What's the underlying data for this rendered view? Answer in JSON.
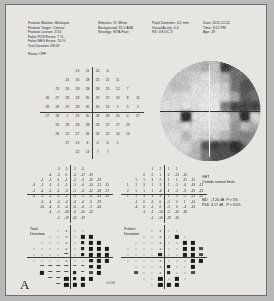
{
  "panel_label": "A",
  "header": {
    "col1": [
      "Fixation Monitor: Blinkspot",
      "Fixation Target: Central",
      "Fixation Losses: 2/13",
      "False POS Errors:  7 %",
      "False NEG Errors: 10 %",
      "Test Duration: 08:09"
    ],
    "fovea": "Fovea: OFF",
    "col2": [
      "Stimulus: III, White",
      "Background: 31.5 ASB",
      "Strategy: SITA-Fast"
    ],
    "col3": [
      "Pupil Diameter: 4.2 mm",
      "Visual Acuity: 0.4",
      "RX:       DS       DC      X"
    ],
    "col4": [
      "Date: 2011-12-22",
      "Time: 3:01 PM",
      "Age: 29"
    ]
  },
  "threshold_plot": {
    "name": "numeric-threshold-grid",
    "unit": "dB",
    "rows": [
      {
        "y": 27,
        "xs": [
          -9,
          -3,
          3,
          9
        ],
        "values": [
          23,
          21,
          24,
          4
        ]
      },
      {
        "y": 21,
        "xs": [
          -15,
          -9,
          -3,
          3,
          9,
          15
        ],
        "values": [
          24,
          26,
          28,
          25,
          21,
          11
        ]
      },
      {
        "y": 15,
        "xs": [
          -21,
          -15,
          -9,
          -3,
          3,
          9,
          15,
          21
        ],
        "values": [
          23,
          24,
          28,
          28,
          28,
          25,
          12,
          7
        ]
      },
      {
        "y": 9,
        "xs": [
          -27,
          -21,
          -15,
          -9,
          -3,
          3,
          9,
          15,
          21,
          27
        ],
        "values": [
          26,
          27,
          28,
          28,
          30,
          29,
          27,
          20,
          8,
          11
        ]
      },
      {
        "y": 3,
        "xs": [
          -27,
          -21,
          -15,
          -9,
          -3,
          3,
          9,
          15,
          21,
          27
        ],
        "values": [
          28,
          28,
          29,
          28,
          30,
          30,
          13,
          5,
          5,
          5
        ]
      },
      {
        "y": -3,
        "xs": [
          -27,
          -21,
          -15,
          -9,
          -3,
          3,
          9,
          15,
          21,
          27
        ],
        "values": [
          27,
          28,
          1,
          29,
          30,
          28,
          28,
          20,
          0,
          27
        ]
      },
      {
        "y": -9,
        "xs": [
          -21,
          -15,
          -9,
          -3,
          3,
          9,
          15,
          21
        ],
        "values": [
          26,
          28,
          28,
          28,
          28,
          27,
          17,
          23
        ]
      },
      {
        "y": -15,
        "xs": [
          -21,
          -15,
          -9,
          -3,
          3,
          9,
          15,
          21
        ],
        "values": [
          28,
          22,
          27,
          26,
          26,
          22,
          16,
          14
        ]
      },
      {
        "y": -21,
        "xs": [
          -15,
          -9,
          -3,
          3,
          9,
          15
        ],
        "values": [
          27,
          23,
          8,
          4,
          6,
          1
        ]
      },
      {
        "y": -27,
        "xs": [
          -9,
          -3,
          3,
          9
        ],
        "values": [
          22,
          13,
          7,
          7
        ]
      }
    ]
  },
  "total_deviation_numeric": {
    "name": "total-deviation-numeric",
    "rows": [
      {
        "y": 27,
        "xs": [
          -9,
          -3,
          3,
          9
        ],
        "values": [
          -3,
          -5,
          -1,
          -5
        ]
      },
      {
        "y": 21,
        "xs": [
          -15,
          -9,
          -3,
          3,
          9,
          15
        ],
        "values": [
          -4,
          -3,
          0,
          -4,
          -17,
          -19
        ]
      },
      {
        "y": 15,
        "xs": [
          -21,
          -15,
          -9,
          -3,
          3,
          9,
          15,
          21
        ],
        "values": [
          -1,
          -1,
          0,
          -1,
          -1,
          -3,
          -15,
          -19
        ]
      },
      {
        "y": 9,
        "xs": [
          -27,
          -21,
          -15,
          -9,
          -3,
          3,
          9,
          15,
          21,
          27
        ],
        "values": [
          -4,
          -1,
          -1,
          -1,
          -1,
          -1,
          -4,
          -10,
          -21,
          -15
        ]
      },
      {
        "y": 3,
        "xs": [
          -27,
          -21,
          -15,
          -9,
          -3,
          3,
          9,
          15,
          21,
          27
        ],
        "values": [
          -2,
          -4,
          -1,
          -1,
          -3,
          -1,
          -4,
          -12,
          -18,
          -17
        ]
      },
      {
        "y": -3,
        "xs": [
          -27,
          -21,
          -15,
          -9,
          -3,
          3,
          9,
          15,
          21,
          27
        ],
        "values": [
          -3,
          -2,
          -1,
          -1,
          -1,
          -3,
          -1,
          -4,
          -14,
          -19
        ]
      },
      {
        "y": -9,
        "xs": [
          -21,
          -15,
          -9,
          -3,
          3,
          9,
          15,
          21
        ],
        "values": [
          -5,
          -4,
          -4,
          -4,
          -4,
          -4,
          -5,
          -19
        ]
      },
      {
        "y": -15,
        "xs": [
          -21,
          -15,
          -9,
          -3,
          3,
          9,
          15,
          21
        ],
        "values": [
          -10,
          -4,
          -5,
          -4,
          -6,
          -4,
          -7,
          -20
        ]
      },
      {
        "y": -21,
        "xs": [
          -15,
          -9,
          -3,
          3,
          9,
          15
        ],
        "values": [
          -4,
          -5,
          -18,
          -6,
          -20,
          -22
        ]
      },
      {
        "y": -27,
        "xs": [
          -9,
          -3,
          3,
          9
        ],
        "values": [
          -5,
          -19,
          -22,
          -19
        ]
      }
    ]
  },
  "pattern_deviation_numeric": {
    "name": "pattern-deviation-numeric",
    "rows": [
      {
        "y": 27,
        "xs": [
          -9,
          -3,
          3,
          9
        ],
        "values": [
          1,
          2,
          1,
          1
        ]
      },
      {
        "y": 21,
        "xs": [
          -15,
          -9,
          -3,
          3,
          9,
          15
        ],
        "values": [
          0,
          2,
          1,
          0,
          -13,
          -15
        ]
      },
      {
        "y": 15,
        "xs": [
          -21,
          -15,
          -9,
          -3,
          3,
          9,
          15,
          21
        ],
        "values": [
          1,
          1,
          3,
          2,
          1,
          1,
          -11,
          -15
        ]
      },
      {
        "y": 9,
        "xs": [
          -27,
          -21,
          -15,
          -9,
          -3,
          3,
          9,
          15,
          21,
          27
        ],
        "values": [
          1,
          1,
          3,
          1,
          3,
          2,
          -1,
          -6,
          -18,
          -12
        ]
      },
      {
        "y": 3,
        "xs": [
          -27,
          -21,
          -15,
          -9,
          -3,
          3,
          9,
          15,
          21,
          27
        ],
        "values": [
          2,
          1,
          1,
          1,
          -6,
          4,
          -1,
          -9,
          -15,
          -13
        ]
      },
      {
        "y": -3,
        "xs": [
          -27,
          -21,
          -15,
          -9,
          -3,
          3,
          9,
          15,
          21,
          27
        ],
        "values": [
          1,
          1,
          3,
          3,
          3,
          1,
          3,
          -1,
          -11,
          -15
        ]
      },
      {
        "y": -9,
        "xs": [
          -21,
          -15,
          -9,
          -3,
          3,
          9,
          15,
          21
        ],
        "values": [
          -1,
          0,
          -1,
          0,
          -1,
          0,
          1,
          -14
        ]
      },
      {
        "y": -15,
        "xs": [
          -21,
          -15,
          -9,
          -3,
          3,
          9,
          15,
          21
        ],
        "values": [
          -6,
          0,
          -1,
          0,
          -2,
          0,
          -4,
          -16
        ]
      },
      {
        "y": -21,
        "xs": [
          -15,
          -9,
          -3,
          3,
          9,
          15
        ],
        "values": [
          -1,
          -1,
          -14,
          -2,
          -16,
          -18
        ]
      },
      {
        "y": -27,
        "xs": [
          -9,
          -3,
          3,
          9
        ],
        "values": [
          -1,
          -16,
          -19,
          -16
        ]
      }
    ]
  },
  "total_deviation_symbols": {
    "name": "total-deviation-probability",
    "rows": [
      {
        "y": 27,
        "xs": [
          -9,
          -3,
          3,
          9
        ],
        "levels": [
          0,
          0,
          0,
          0
        ]
      },
      {
        "y": 21,
        "xs": [
          -15,
          -9,
          -3,
          3,
          9,
          15
        ],
        "levels": [
          0,
          0,
          0,
          0,
          4,
          4
        ]
      },
      {
        "y": 15,
        "xs": [
          -21,
          -15,
          -9,
          -3,
          3,
          9,
          15,
          21
        ],
        "levels": [
          0,
          0,
          0,
          0,
          0,
          2,
          4,
          4
        ]
      },
      {
        "y": 9,
        "xs": [
          -27,
          -21,
          -15,
          -9,
          -3,
          3,
          9,
          15,
          21,
          27
        ],
        "levels": [
          0,
          0,
          0,
          0,
          0,
          0,
          2,
          4,
          4,
          4
        ]
      },
      {
        "y": 3,
        "xs": [
          -27,
          -21,
          -15,
          -9,
          -3,
          3,
          9,
          15,
          21,
          27
        ],
        "levels": [
          0,
          0,
          0,
          0,
          1,
          0,
          2,
          4,
          4,
          4
        ]
      },
      {
        "y": -3,
        "xs": [
          -27,
          -21,
          -15,
          -9,
          -3,
          3,
          9,
          15,
          21,
          27
        ],
        "levels": [
          0,
          0,
          0,
          0,
          0,
          0,
          0,
          2,
          4,
          4
        ]
      },
      {
        "y": -9,
        "xs": [
          -21,
          -15,
          -9,
          -3,
          3,
          9,
          15,
          21
        ],
        "levels": [
          1,
          1,
          1,
          1,
          1,
          1,
          2,
          4
        ]
      },
      {
        "y": -15,
        "xs": [
          -21,
          -15,
          -9,
          -3,
          3,
          9,
          15,
          21
        ],
        "levels": [
          4,
          1,
          1,
          1,
          2,
          1,
          3,
          4
        ]
      },
      {
        "y": -21,
        "xs": [
          -15,
          -9,
          -3,
          3,
          9,
          15
        ],
        "levels": [
          1,
          1,
          4,
          2,
          4,
          4
        ]
      },
      {
        "y": -27,
        "xs": [
          -9,
          -3,
          3,
          9
        ],
        "levels": [
          1,
          4,
          4,
          4
        ]
      }
    ]
  },
  "pattern_deviation_symbols": {
    "name": "pattern-deviation-probability",
    "rows": [
      {
        "y": 27,
        "xs": [
          -9,
          -3,
          3,
          9
        ],
        "levels": [
          0,
          0,
          0,
          0
        ]
      },
      {
        "y": 21,
        "xs": [
          -15,
          -9,
          -3,
          3,
          9,
          15
        ],
        "levels": [
          0,
          0,
          0,
          0,
          4,
          0
        ]
      },
      {
        "y": 15,
        "xs": [
          -21,
          -15,
          -9,
          -3,
          3,
          9,
          15,
          21
        ],
        "levels": [
          0,
          0,
          0,
          0,
          0,
          0,
          4,
          4
        ]
      },
      {
        "y": 9,
        "xs": [
          -27,
          -21,
          -15,
          -9,
          -3,
          3,
          9,
          15,
          21,
          27
        ],
        "levels": [
          0,
          0,
          0,
          0,
          0,
          0,
          0,
          4,
          4,
          3
        ]
      },
      {
        "y": 3,
        "xs": [
          -27,
          -21,
          -15,
          -9,
          -3,
          3,
          9,
          15,
          21,
          27
        ],
        "levels": [
          0,
          0,
          0,
          0,
          2,
          0,
          0,
          4,
          4,
          3
        ]
      },
      {
        "y": -3,
        "xs": [
          -27,
          -21,
          -15,
          -9,
          -3,
          3,
          9,
          15,
          21,
          27
        ],
        "levels": [
          0,
          0,
          0,
          0,
          0,
          0,
          0,
          0,
          4,
          4
        ]
      },
      {
        "y": -9,
        "xs": [
          -21,
          -15,
          -9,
          -3,
          3,
          9,
          15,
          21
        ],
        "levels": [
          0,
          0,
          0,
          0,
          2,
          0,
          0,
          4
        ]
      },
      {
        "y": -15,
        "xs": [
          -21,
          -15,
          -9,
          -3,
          3,
          9,
          15,
          21
        ],
        "levels": [
          3,
          0,
          0,
          0,
          2,
          0,
          0,
          3
        ]
      },
      {
        "y": -21,
        "xs": [
          -15,
          -9,
          -3,
          3,
          9,
          15
        ],
        "levels": [
          0,
          0,
          4,
          0,
          4,
          0
        ]
      },
      {
        "y": -27,
        "xs": [
          -9,
          -3,
          3,
          9
        ],
        "levels": [
          0,
          4,
          4,
          4
        ]
      }
    ]
  },
  "labels": {
    "total_deviation": [
      "Total",
      "Deviation"
    ],
    "pattern_deviation": [
      "Pattern",
      "Deviation"
    ]
  },
  "ght": {
    "title": "GHT",
    "result": "Outside normal limits"
  },
  "indices": [
    {
      "name": "MD",
      "value": "-7.20 dB",
      "p": "P < 5%"
    },
    {
      "name": "PSD",
      "value": "6.17 dB",
      "p": "P < 0.5%"
    }
  ],
  "legend_note": "< 0.5%",
  "greyscale": {
    "name": "greyscale-plot",
    "description": "Humphrey 30-2 greyscale: dense dark defect temporal-superior and inferior-nasal, blind spot nasal-left",
    "blind_spot": {
      "x": -15,
      "y": -3
    }
  }
}
